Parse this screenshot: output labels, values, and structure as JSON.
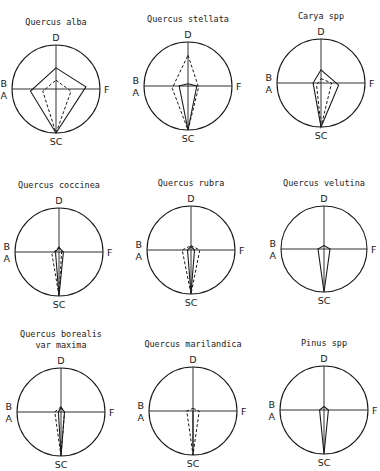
{
  "figure": {
    "axis_labels": {
      "top": "D",
      "left_upper": "B",
      "left_lower": "A",
      "right": "F",
      "bottom": "SC"
    },
    "panels": [
      {
        "title_lines": [
          "Quercus alba"
        ],
        "cx": 56,
        "cy": 89,
        "r": 44,
        "solid": [
          [
            0,
            -0.48
          ],
          [
            0.68,
            -0.05
          ],
          [
            0,
            1.0
          ],
          [
            -0.58,
            0.05
          ]
        ],
        "dashed": [
          [
            0,
            -0.2
          ],
          [
            0.34,
            0.05
          ],
          [
            0,
            1.0
          ],
          [
            -0.3,
            0.05
          ]
        ]
      },
      {
        "title_lines": [
          "Quercus stellata"
        ],
        "cx": 188,
        "cy": 86,
        "r": 44,
        "solid": [
          [
            0,
            -0.05
          ],
          [
            0.2,
            0.0
          ],
          [
            0,
            1.0
          ],
          [
            -0.2,
            0.0
          ]
        ],
        "dashed": [
          [
            0,
            -0.7
          ],
          [
            0.24,
            0.03
          ],
          [
            0,
            1.0
          ],
          [
            -0.36,
            0.05
          ]
        ]
      },
      {
        "title_lines": [
          "Carya spp"
        ],
        "cx": 321,
        "cy": 83,
        "r": 44,
        "solid": [
          [
            0,
            -0.3
          ],
          [
            0.4,
            0.05
          ],
          [
            0,
            1.0
          ],
          [
            -0.18,
            0.0
          ]
        ],
        "dashed": [
          [
            0,
            -0.1
          ],
          [
            0.24,
            0.0
          ],
          [
            0,
            1.0
          ],
          [
            -0.1,
            0.05
          ]
        ]
      },
      {
        "title_lines": [
          "Quercus coccinea"
        ],
        "cx": 59,
        "cy": 252,
        "r": 44,
        "solid": [
          [
            0,
            -0.1
          ],
          [
            0.1,
            0.0
          ],
          [
            0,
            1.0
          ],
          [
            -0.08,
            0.0
          ]
        ],
        "dashed": [
          [
            0,
            -0.12
          ],
          [
            0.06,
            0.0
          ],
          [
            0,
            1.0
          ],
          [
            -0.16,
            0.05
          ]
        ]
      },
      {
        "title_lines": [
          "Quercus rubra"
        ],
        "cx": 191,
        "cy": 250,
        "r": 44,
        "solid": [
          [
            0,
            -0.08
          ],
          [
            0.08,
            0.0
          ],
          [
            0,
            1.0
          ],
          [
            -0.08,
            0.0
          ]
        ],
        "dashed": [
          [
            0,
            -0.1
          ],
          [
            0.2,
            0.0
          ],
          [
            0,
            1.0
          ],
          [
            -0.2,
            0.0
          ]
        ]
      },
      {
        "title_lines": [
          "Quercus velutina"
        ],
        "cx": 324,
        "cy": 249,
        "r": 43,
        "solid": [
          [
            0,
            -0.08
          ],
          [
            0.14,
            0.0
          ],
          [
            0,
            1.0
          ],
          [
            -0.14,
            0.0
          ]
        ],
        "dashed": []
      },
      {
        "title_lines": [
          "Quercus borealis",
          "var maxima"
        ],
        "cx": 61,
        "cy": 412,
        "r": 44,
        "solid": [
          [
            0,
            -0.1
          ],
          [
            0.08,
            0.0
          ],
          [
            0,
            1.0
          ],
          [
            -0.06,
            0.0
          ]
        ],
        "dashed": [
          [
            0,
            -0.12
          ],
          [
            0.08,
            0.0
          ],
          [
            0,
            1.0
          ],
          [
            -0.14,
            0.0
          ]
        ]
      },
      {
        "title_lines": [
          "Quercus marilandica"
        ],
        "cx": 193,
        "cy": 411,
        "r": 44,
        "solid": [
          [
            0,
            0.0
          ],
          [
            0,
            1.0
          ]
        ],
        "dashed": [
          [
            0,
            -0.06
          ],
          [
            0.14,
            0.0
          ],
          [
            0,
            1.0
          ],
          [
            -0.14,
            0.0
          ]
        ]
      },
      {
        "title_lines": [
          "Pinus spp"
        ],
        "cx": 324,
        "cy": 410,
        "r": 44,
        "solid": [
          [
            0,
            -0.08
          ],
          [
            0.1,
            0.0
          ],
          [
            0,
            1.0
          ],
          [
            -0.1,
            0.0
          ]
        ],
        "dashed": []
      }
    ]
  }
}
